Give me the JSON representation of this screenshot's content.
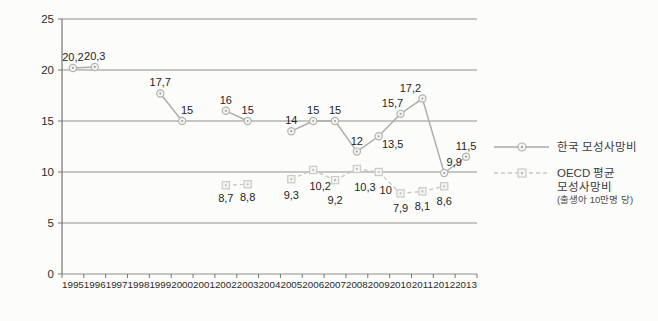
{
  "chart_data": {
    "type": "line",
    "title": "",
    "x_tick_labels": [
      "1995",
      "1996",
      "1997",
      "1998",
      "1999",
      "2000",
      "2001",
      "2002",
      "2003",
      "2004",
      "2005",
      "2006",
      "2007",
      "2008",
      "2009",
      "2010",
      "2011",
      "2012",
      "2013"
    ],
    "x_years": [
      1995,
      1996,
      1997,
      1998,
      1999,
      2000,
      2001,
      2002,
      2003,
      2004,
      2005,
      2006,
      2007,
      2008,
      2009,
      2010,
      2011,
      2012,
      2013
    ],
    "y_ticks": [
      0,
      5,
      10,
      15,
      20,
      25
    ],
    "y_tick_labels": [
      "0",
      "5",
      "10",
      "15",
      "20",
      "25"
    ],
    "ylim": [
      0,
      25
    ],
    "grid": "horizontal-only",
    "legend_position": "right",
    "series": [
      {
        "name": "한국 모성사망비",
        "marker": "circle",
        "line_style": "solid",
        "label_side": "above",
        "points": [
          {
            "year": 1995,
            "value": 20.2,
            "label": "20,2"
          },
          {
            "year": 1996,
            "value": 20.3,
            "label": "20,3"
          },
          {
            "year": 1999,
            "value": 17.7,
            "label": "17,7"
          },
          {
            "year": 2000,
            "value": 15,
            "label": "15",
            "dx": 5
          },
          {
            "year": 2002,
            "value": 16,
            "label": "16"
          },
          {
            "year": 2003,
            "value": 15,
            "label": "15"
          },
          {
            "year": 2005,
            "value": 14,
            "label": "14"
          },
          {
            "year": 2006,
            "value": 15,
            "label": "15"
          },
          {
            "year": 2007,
            "value": 15,
            "label": "15"
          },
          {
            "year": 2008,
            "value": 12,
            "label": "12"
          },
          {
            "year": 2009,
            "value": 13.5,
            "label": "13,5",
            "dx": 14,
            "dy": 19
          },
          {
            "year": 2010,
            "value": 15.7,
            "label": "15,7",
            "dx": -8
          },
          {
            "year": 2011,
            "value": 17.2,
            "label": "17,2",
            "dx": -12
          },
          {
            "year": 2012,
            "value": 9.9,
            "label": "9,9",
            "dx": 10
          },
          {
            "year": 2013,
            "value": 11.5,
            "label": "11,5"
          }
        ]
      },
      {
        "name": "OECD 평균 모성사망비 (출생아 10만명 당)",
        "marker": "square",
        "line_style": "dashed",
        "label_side": "below",
        "points": [
          {
            "year": 2002,
            "value": 8.7,
            "label": "8,7"
          },
          {
            "year": 2003,
            "value": 8.8,
            "label": "8,8"
          },
          {
            "year": 2005,
            "value": 9.3,
            "label": "9,3",
            "dy": 3
          },
          {
            "year": 2006,
            "value": 10.2,
            "label": "10,2",
            "dx": 7,
            "dy": 3
          },
          {
            "year": 2007,
            "value": 9.2,
            "label": "9,2",
            "dy": 7
          },
          {
            "year": 2008,
            "value": 10.3,
            "label": "10,3",
            "dx": 8,
            "dy": 5
          },
          {
            "year": 2009,
            "value": 10,
            "label": "10",
            "dx": 7,
            "dy": 5
          },
          {
            "year": 2010,
            "value": 7.9,
            "label": "7,9",
            "dy": 2
          },
          {
            "year": 2011,
            "value": 8.1,
            "label": "8,1",
            "dy": 2
          },
          {
            "year": 2012,
            "value": 8.6,
            "label": "8,6",
            "dy": 2
          }
        ]
      }
    ]
  },
  "legend": {
    "korea_label": "한국 모성사망비",
    "oecd_label_line1": "OECD 평균",
    "oecd_label_line2": "모성사망비",
    "oecd_label_line3": "(출생아 10만명 당)"
  },
  "colors": {
    "background": "#fcfcfb",
    "gridline": "#8f8f8f",
    "axis": "#757575",
    "korea_line": "#ababa9",
    "korea_marker_stroke": "#b3b3b1",
    "korea_marker_fill": "#f4f4f2",
    "korea_marker_dot": "#a3a3a1",
    "oecd_line": "#c7c7c5",
    "oecd_marker_stroke": "#cacac8",
    "oecd_marker_fill": "#f5f5f3",
    "oecd_marker_dot": "#bcbcba",
    "data_label": "#1c1c1c",
    "axis_label": "#2a2a2a"
  }
}
